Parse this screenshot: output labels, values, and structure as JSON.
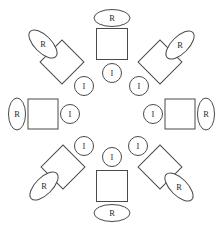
{
  "diagram": {
    "type": "radial-node-diagram",
    "background_color": "#ffffff",
    "stroke_color": "#4a4a4a",
    "fill_color": "#ffffff",
    "text_color": "#2b2b2b",
    "center": {
      "x": 112,
      "y": 114
    },
    "labels": {
      "resource": "R",
      "interface": "I"
    },
    "units": [
      {
        "id": "unit-north",
        "position": "top",
        "angle_deg": 0,
        "square": {
          "cx": 112,
          "cy": 44,
          "size": 31,
          "rotate": 0
        },
        "outer_ellipse": {
          "cx": 112,
          "cy": 18,
          "rx": 18,
          "ry": 8.5,
          "rotate": 0,
          "label": "R"
        },
        "inner_circle": {
          "cx": 112,
          "cy": 73,
          "rx": 9.5,
          "ry": 9.5,
          "rotate": 0,
          "label": "I"
        }
      },
      {
        "id": "unit-northeast",
        "position": "top-right",
        "angle_deg": 45,
        "square": {
          "cx": 160,
          "cy": 62,
          "size": 31,
          "rotate": 45
        },
        "outer_ellipse": {
          "cx": 180,
          "cy": 45,
          "rx": 18,
          "ry": 8.5,
          "rotate": -45,
          "label": "R"
        },
        "inner_circle": {
          "cx": 139,
          "cy": 86,
          "rx": 9.5,
          "ry": 9.5,
          "rotate": 0,
          "label": "I"
        }
      },
      {
        "id": "unit-east",
        "position": "right",
        "angle_deg": 90,
        "square": {
          "cx": 180,
          "cy": 114,
          "size": 30,
          "rotate": 0
        },
        "outer_ellipse": {
          "cx": 206,
          "cy": 114,
          "rx": 8.5,
          "ry": 16,
          "rotate": 0,
          "label": "R"
        },
        "inner_circle": {
          "cx": 153,
          "cy": 114,
          "rx": 9.5,
          "ry": 9.5,
          "rotate": 0,
          "label": "I"
        }
      },
      {
        "id": "unit-southeast",
        "position": "bottom-right",
        "angle_deg": 135,
        "square": {
          "cx": 160,
          "cy": 167,
          "size": 31,
          "rotate": 45
        },
        "outer_ellipse": {
          "cx": 179,
          "cy": 187,
          "rx": 18,
          "ry": 8.5,
          "rotate": 45,
          "label": "R"
        },
        "inner_circle": {
          "cx": 138,
          "cy": 146,
          "rx": 9.5,
          "ry": 9.5,
          "rotate": 0,
          "label": "I"
        }
      },
      {
        "id": "unit-south",
        "position": "bottom",
        "angle_deg": 180,
        "square": {
          "cx": 112,
          "cy": 186,
          "size": 31,
          "rotate": 0
        },
        "outer_ellipse": {
          "cx": 112,
          "cy": 213,
          "rx": 18,
          "ry": 8.5,
          "rotate": 0,
          "label": "R"
        },
        "inner_circle": {
          "cx": 112,
          "cy": 157,
          "rx": 9.5,
          "ry": 9.5,
          "rotate": 0,
          "label": "I"
        }
      },
      {
        "id": "unit-southwest",
        "position": "bottom-left",
        "angle_deg": 225,
        "square": {
          "cx": 63,
          "cy": 167,
          "size": 31,
          "rotate": 45
        },
        "outer_ellipse": {
          "cx": 44,
          "cy": 186,
          "rx": 18,
          "ry": 8.5,
          "rotate": -45,
          "label": "R"
        },
        "inner_circle": {
          "cx": 84,
          "cy": 146,
          "rx": 9.5,
          "ry": 9.5,
          "rotate": 0,
          "label": "I"
        }
      },
      {
        "id": "unit-west",
        "position": "left",
        "angle_deg": 270,
        "square": {
          "cx": 43,
          "cy": 114,
          "size": 30,
          "rotate": 0
        },
        "outer_ellipse": {
          "cx": 17,
          "cy": 114,
          "rx": 8.5,
          "ry": 16,
          "rotate": 0,
          "label": "R"
        },
        "inner_circle": {
          "cx": 70,
          "cy": 114,
          "rx": 9.5,
          "ry": 9.5,
          "rotate": 0,
          "label": "I"
        }
      },
      {
        "id": "unit-northwest",
        "position": "top-left",
        "angle_deg": 315,
        "square": {
          "cx": 62,
          "cy": 62,
          "size": 31,
          "rotate": 45
        },
        "outer_ellipse": {
          "cx": 43,
          "cy": 44,
          "rx": 18,
          "ry": 8.5,
          "rotate": 45,
          "label": "R"
        },
        "inner_circle": {
          "cx": 84,
          "cy": 86,
          "rx": 9.5,
          "ry": 9.5,
          "rotate": 0,
          "label": "I"
        }
      }
    ]
  }
}
